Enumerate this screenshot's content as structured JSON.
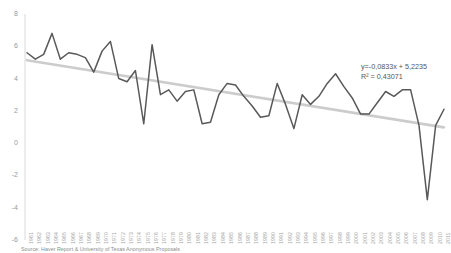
{
  "chart_data": {
    "type": "line",
    "title": "",
    "xlabel": "",
    "ylabel": "",
    "ylim": [
      -6,
      8
    ],
    "ytick_step": 2,
    "yticks": [
      8,
      6,
      4,
      2,
      0,
      -2,
      -4,
      -6
    ],
    "grid": false,
    "legend": false,
    "categories": [
      "1961",
      "1962",
      "1963",
      "1964",
      "1965",
      "1966",
      "1967",
      "1968",
      "1969",
      "1970",
      "1971",
      "1972",
      "1973",
      "1974",
      "1975",
      "1976",
      "1977",
      "1978",
      "1979",
      "1980",
      "1981",
      "1982",
      "1983",
      "1984",
      "1985",
      "1986",
      "1987",
      "1988",
      "1989",
      "1990",
      "1991",
      "1992",
      "1993",
      "1994",
      "1995",
      "1996",
      "1997",
      "1998",
      "1999",
      "2000",
      "2001",
      "2002",
      "2003",
      "2004",
      "2005",
      "2006",
      "2007",
      "2008",
      "2009",
      "2010",
      "2011"
    ],
    "series": [
      {
        "name": "annual-growth",
        "color": "#595959",
        "values": [
          5.6,
          5.2,
          5.5,
          6.8,
          5.2,
          5.6,
          5.5,
          5.3,
          4.4,
          5.7,
          6.3,
          4.0,
          3.8,
          4.5,
          1.2,
          6.1,
          3.0,
          3.3,
          2.6,
          3.2,
          3.3,
          1.2,
          1.3,
          3.0,
          3.7,
          3.6,
          2.9,
          2.3,
          1.6,
          1.7,
          3.7,
          2.4,
          0.9,
          3.0,
          2.4,
          2.9,
          3.7,
          4.3,
          3.5,
          2.8,
          1.8,
          1.8,
          2.5,
          3.2,
          2.9,
          3.3,
          3.3,
          1.1,
          -3.5,
          1.1,
          2.1
        ]
      }
    ],
    "trendline": {
      "name": "linear-trend",
      "color": "#cccccc",
      "slope": -0.0833,
      "intercept": 5.2235,
      "equation": "y=-0,0833x + 5,2235",
      "r_squared_label": "R² = 0,43071"
    }
  },
  "annotation": {
    "line1": "y=-0,0833x + 5,2235",
    "line2": "R² = 0,43071"
  },
  "footer": {
    "source": "Source: Haver Report & University of Texas Anonymous Proposals"
  }
}
